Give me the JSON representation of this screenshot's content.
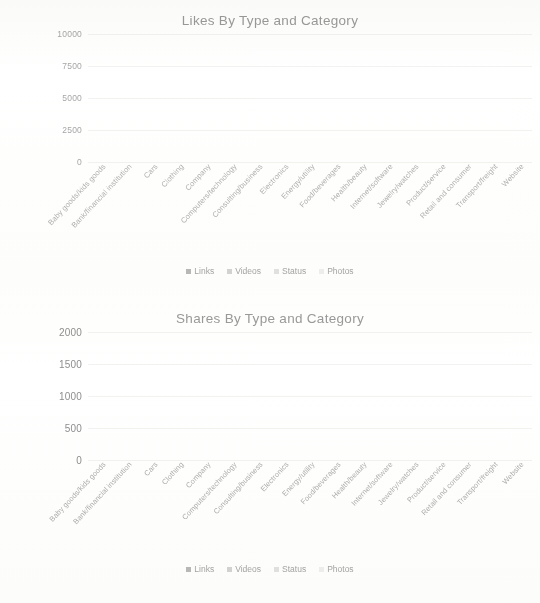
{
  "colors": {
    "links": "#b9b9b9",
    "videos": "#d4d4d4",
    "status": "#e2e2e2",
    "photos": "#ededed",
    "background": "#ffffff",
    "text": "#9a9a9a",
    "gridline": "#f2f2f0"
  },
  "charts": [
    {
      "id": "likes",
      "title": "Likes By Type and Category",
      "y_ticks": [
        "10000",
        "7500",
        "5000",
        "2500",
        "0"
      ],
      "legend": [
        "Links",
        "Videos",
        "Status",
        "Photos"
      ]
    },
    {
      "id": "shares",
      "title": "Shares By Type and Category",
      "y_ticks": [
        "2000",
        "1500",
        "1000",
        "500",
        "0"
      ],
      "legend": [
        "Links",
        "Videos",
        "Status",
        "Photos"
      ]
    }
  ],
  "chart_data": [
    {
      "type": "bar",
      "stacked": true,
      "title": "Likes By Type and Category",
      "xlabel": "",
      "ylabel": "",
      "ylim": [
        0,
        10000
      ],
      "yticks": [
        0,
        2500,
        5000,
        7500,
        10000
      ],
      "grid": true,
      "legend_position": "bottom",
      "categories": [
        "Baby goods/kids goods",
        "Bank/financial institution",
        "Cars",
        "Clothing",
        "Company",
        "Computers/technology",
        "Consulting/business",
        "Electronics",
        "Energy/utility",
        "Food/beverages",
        "Health/beauty",
        "Internet/software",
        "Jewelry/watches",
        "Product/service",
        "Retail and consumer",
        "Transport/freight",
        "Website"
      ],
      "series": [
        {
          "name": "Links",
          "values": [
            2100,
            60,
            1350,
            900,
            1150,
            40,
            0,
            330,
            420,
            180,
            900,
            0,
            760,
            560,
            480,
            350,
            420
          ]
        },
        {
          "name": "Videos",
          "values": [
            3300,
            30,
            5000,
            3900,
            4350,
            20,
            0,
            2200,
            3200,
            2700,
            760,
            0,
            4500,
            8900,
            1500,
            480,
            1200
          ]
        },
        {
          "name": "Status",
          "values": [
            300,
            10,
            500,
            380,
            420,
            10,
            0,
            220,
            300,
            260,
            120,
            0,
            420,
            700,
            180,
            90,
            150
          ]
        },
        {
          "name": "Photos",
          "values": [
            150,
            5,
            250,
            180,
            200,
            5,
            0,
            110,
            150,
            130,
            60,
            0,
            200,
            350,
            90,
            50,
            80
          ]
        }
      ]
    },
    {
      "type": "bar",
      "stacked": true,
      "title": "Shares By Type and Category",
      "xlabel": "",
      "ylabel": "",
      "ylim": [
        0,
        2000
      ],
      "yticks": [
        0,
        500,
        1000,
        1500,
        2000
      ],
      "grid": true,
      "legend_position": "bottom",
      "categories": [
        "Baby goods/kids goods",
        "Bank/financial institution",
        "Cars",
        "Clothing",
        "Company",
        "Computers/technology",
        "Consulting/business",
        "Electronics",
        "Energy/utility",
        "Food/beverages",
        "Health/beauty",
        "Internet/software",
        "Jewelry/watches",
        "Product/service",
        "Retail and consumer",
        "Transport/freight",
        "Website"
      ],
      "series": [
        {
          "name": "Links",
          "values": [
            120,
            20,
            260,
            90,
            230,
            15,
            0,
            60,
            70,
            40,
            150,
            0,
            170,
            220,
            120,
            110,
            130
          ]
        },
        {
          "name": "Videos",
          "values": [
            230,
            15,
            1050,
            340,
            580,
            10,
            0,
            110,
            140,
            90,
            150,
            0,
            420,
            1250,
            290,
            90,
            310
          ]
        },
        {
          "name": "Status",
          "values": [
            50,
            5,
            110,
            45,
            70,
            5,
            0,
            20,
            25,
            15,
            35,
            0,
            60,
            130,
            50,
            20,
            45
          ]
        },
        {
          "name": "Photos",
          "values": [
            25,
            3,
            60,
            22,
            35,
            2,
            0,
            10,
            12,
            8,
            18,
            0,
            30,
            70,
            25,
            10,
            22
          ]
        }
      ]
    }
  ]
}
